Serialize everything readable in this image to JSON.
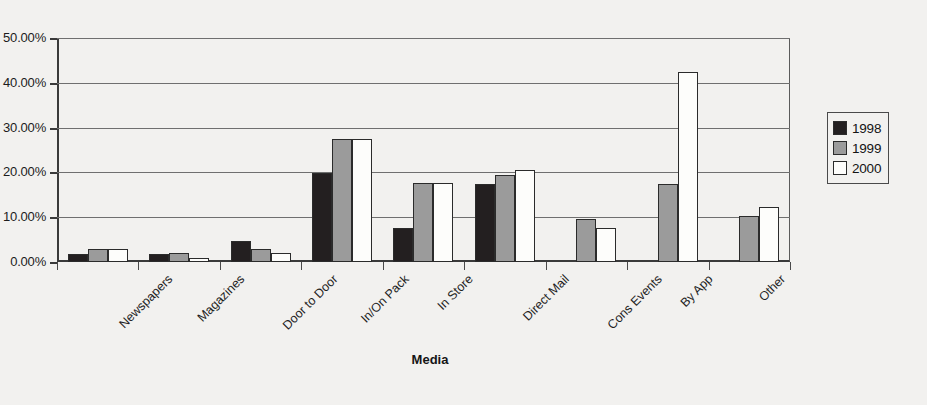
{
  "chart_data": {
    "type": "bar",
    "title": "",
    "xlabel": "Media",
    "ylabel": "",
    "ylim": [
      0,
      50
    ],
    "ytick_labels": [
      "0.00%",
      "10.00%",
      "20.00%",
      "30.00%",
      "40.00%",
      "50.00%"
    ],
    "ytick_values": [
      0,
      10,
      20,
      30,
      40,
      50
    ],
    "grid": true,
    "legend_position": "right",
    "categories": [
      "Newspapers",
      "Magazines",
      "Door to Door",
      "In/On Pack",
      "In Store",
      "Direct Mail",
      "Cons Events",
      "By App",
      "Other"
    ],
    "series": [
      {
        "name": "1998",
        "color": "#231f20",
        "values": [
          1.8,
          1.8,
          4.8,
          19.8,
          7.5,
          17.5,
          0,
          0,
          0
        ]
      },
      {
        "name": "1999",
        "color": "#9b9b9b",
        "values": [
          3.0,
          2.0,
          3.0,
          27.5,
          17.7,
          19.5,
          9.6,
          17.5,
          10.3
        ]
      },
      {
        "name": "2000",
        "color": "#fdfdfb",
        "values": [
          3.0,
          1.0,
          2.0,
          27.5,
          17.7,
          20.5,
          7.6,
          42.5,
          12.2
        ]
      }
    ]
  }
}
